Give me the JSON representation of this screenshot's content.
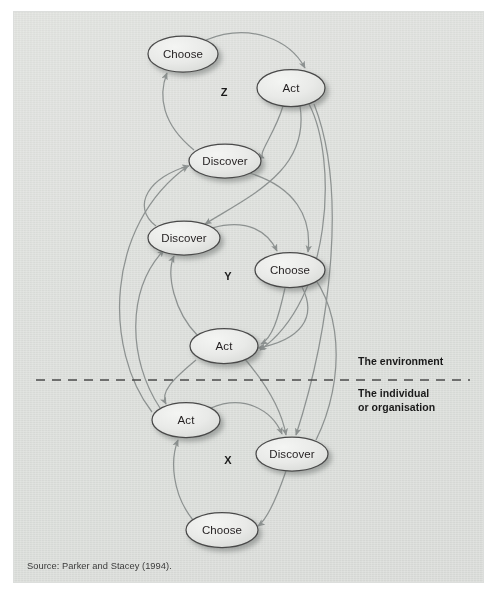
{
  "figure": {
    "source_caption": "Source: Parker and Stacey (1994).",
    "background_color": "#ecedeb",
    "node_fill": "#e9eae8",
    "node_stroke": "#4a4a4a",
    "edge_color": "#8d9291",
    "text_color": "#231f20"
  },
  "divider": {
    "name": "environment-boundary",
    "style": "dashed",
    "y": 380,
    "above_label": "The environment",
    "below_label_line1": "The individual",
    "below_label_line2": "or organisation"
  },
  "clusters": [
    {
      "id": "Z",
      "label": "Z",
      "label_x": 224,
      "label_y": 93
    },
    {
      "id": "Y",
      "label": "Y",
      "label_x": 228,
      "label_y": 277
    },
    {
      "id": "X",
      "label": "X",
      "label_x": 228,
      "label_y": 461
    }
  ],
  "nodes": [
    {
      "id": "z-choose",
      "cluster": "Z",
      "label": "Choose",
      "cx": 183,
      "cy": 54,
      "rx": 35,
      "ry": 18
    },
    {
      "id": "z-act",
      "cluster": "Z",
      "label": "Act",
      "cx": 291,
      "cy": 88,
      "rx": 34,
      "ry": 18.5
    },
    {
      "id": "z-discover",
      "cluster": "Z",
      "label": "Discover",
      "cx": 225,
      "cy": 161,
      "rx": 36,
      "ry": 17
    },
    {
      "id": "y-discover",
      "cluster": "Y",
      "label": "Discover",
      "cx": 184,
      "cy": 238,
      "rx": 36,
      "ry": 17
    },
    {
      "id": "y-choose",
      "cluster": "Y",
      "label": "Choose",
      "cx": 290,
      "cy": 270,
      "rx": 35,
      "ry": 17.5
    },
    {
      "id": "y-act",
      "cluster": "Y",
      "label": "Act",
      "cx": 224,
      "cy": 346,
      "rx": 34,
      "ry": 17.5
    },
    {
      "id": "x-act",
      "cluster": "X",
      "label": "Act",
      "cx": 186,
      "cy": 420,
      "rx": 34,
      "ry": 17.5
    },
    {
      "id": "x-discover",
      "cluster": "X",
      "label": "Discover",
      "cx": 292,
      "cy": 454,
      "rx": 36,
      "ry": 17
    },
    {
      "id": "x-choose",
      "cluster": "X",
      "label": "Choose",
      "cx": 222,
      "cy": 530,
      "rx": 36,
      "ry": 17.5
    }
  ],
  "edges": [
    {
      "id": "e1",
      "from": "z-choose",
      "to": "z-act",
      "path": "M 206,40 C 250,22 290,40 305,68"
    },
    {
      "id": "e2",
      "from": "z-act",
      "to": "z-discover",
      "path": "M 283,106 C 274,136 256,155 264,158"
    },
    {
      "id": "e3",
      "from": "z-discover",
      "to": "z-choose",
      "path": "M 194,150 C 162,124 158,96 167,73"
    },
    {
      "id": "e4",
      "from": "z-act",
      "to": "y-discover",
      "path": "M 300,106 C 310,170 250,196 205,224"
    },
    {
      "id": "e5",
      "from": "z-act",
      "to": "x-discover",
      "path": "M 314,104 C 348,190 330,330 296,435"
    },
    {
      "id": "e6",
      "from": "y-discover",
      "to": "y-choose",
      "path": "M 212,228 C 248,218 268,232 277,251"
    },
    {
      "id": "e7",
      "from": "y-choose",
      "to": "y-act",
      "path": "M 285,288 C 278,320 272,338 261,344"
    },
    {
      "id": "e8",
      "from": "y-act",
      "to": "y-discover",
      "path": "M 198,336 C 174,312 166,274 174,256"
    },
    {
      "id": "e9",
      "from": "z-discover",
      "to": "y-choose",
      "path": "M 246,172 C 296,186 312,218 308,252"
    },
    {
      "id": "e10",
      "from": "y-act",
      "to": "x-discover",
      "path": "M 244,358 C 268,386 282,412 286,435"
    },
    {
      "id": "e11",
      "from": "y-act",
      "to": "x-act",
      "path": "M 196,360 C 172,380 160,392 166,404"
    },
    {
      "id": "e12",
      "from": "x-act",
      "to": "x-discover",
      "path": "M 211,408 C 244,394 272,410 282,434"
    },
    {
      "id": "e13",
      "from": "x-discover",
      "to": "x-choose",
      "path": "M 286,471 C 276,500 266,520 258,526"
    },
    {
      "id": "e14",
      "from": "x-choose",
      "to": "x-act",
      "path": "M 193,520 C 172,494 170,460 178,440"
    },
    {
      "id": "e15",
      "from": "x-act",
      "to": "y-discover",
      "path": "M 160,408 C 128,360 126,290 164,250"
    },
    {
      "id": "e16",
      "from": "x-act",
      "to": "z-discover",
      "path": "M 152,412 C 104,350 104,226 188,166"
    },
    {
      "id": "e17",
      "from": "y-discover",
      "to": "z-discover",
      "path": "M 156,226 C 130,206 150,176 189,166"
    },
    {
      "id": "e18",
      "from": "x-discover",
      "to": "y-discover",
      "path": "M 316,440 C 346,380 344,300 300,262"
    },
    {
      "id": "e19",
      "from": "y-choose",
      "to": "y-act",
      "path": "M 302,287 C 318,318 300,340 258,348"
    },
    {
      "id": "e20",
      "from": "z-act",
      "to": "y-act",
      "path": "M 309,104 C 338,160 332,300 260,350"
    }
  ]
}
